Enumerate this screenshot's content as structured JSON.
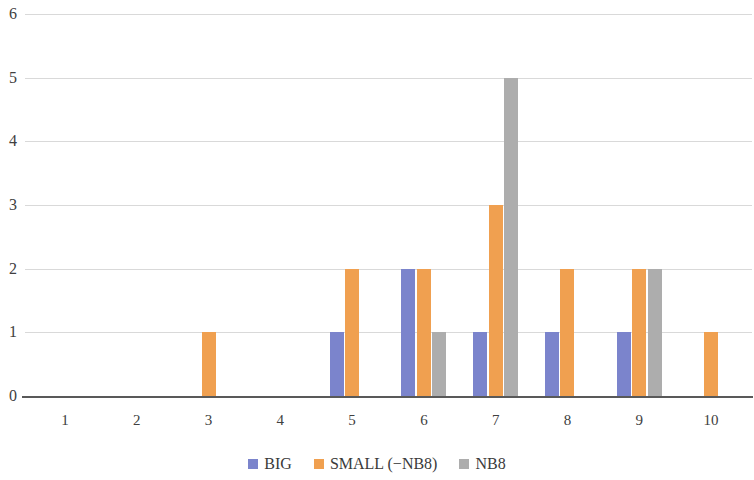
{
  "chart_data": {
    "type": "bar",
    "title": "",
    "xlabel": "",
    "ylabel": "",
    "categories": [
      "1",
      "2",
      "3",
      "4",
      "5",
      "6",
      "7",
      "8",
      "9",
      "10"
    ],
    "series": [
      {
        "name": "BIG",
        "color": "#7b84cc",
        "values": [
          0,
          0,
          0,
          0,
          1,
          2,
          1,
          1,
          1,
          0
        ]
      },
      {
        "name": "SMALL (−NB8)",
        "color": "#f0a050",
        "values": [
          0,
          0,
          1,
          0,
          2,
          2,
          3,
          2,
          2,
          1
        ]
      },
      {
        "name": "NB8",
        "color": "#adadad",
        "values": [
          0,
          0,
          0,
          0,
          0,
          1,
          5,
          0,
          2,
          0
        ]
      }
    ],
    "ylim": [
      0,
      6
    ],
    "y_ticks": [
      "0",
      "1",
      "2",
      "3",
      "4",
      "5",
      "6"
    ],
    "grid": true,
    "legend_position": "bottom"
  },
  "legend": {
    "items": [
      {
        "label": "BIG",
        "color": "#7b84cc"
      },
      {
        "label": "SMALL (−NB8)",
        "color": "#f0a050"
      },
      {
        "label": "NB8",
        "color": "#adadad"
      }
    ]
  },
  "axis": {
    "y_ticks": [
      "0",
      "1",
      "2",
      "3",
      "4",
      "5",
      "6"
    ],
    "x_ticks": [
      "1",
      "2",
      "3",
      "4",
      "5",
      "6",
      "7",
      "8",
      "9",
      "10"
    ]
  }
}
